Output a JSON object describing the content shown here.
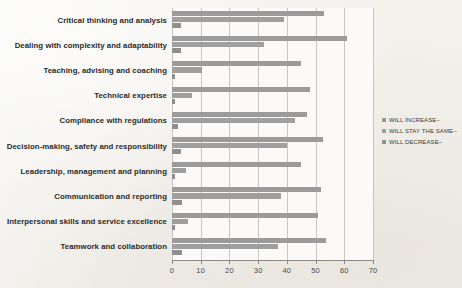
{
  "chart_data": {
    "type": "bar",
    "orientation": "horizontal",
    "title": "",
    "xlabel": "",
    "ylabel": "",
    "xlim": [
      0,
      70
    ],
    "xticks": [
      0,
      10,
      20,
      30,
      40,
      50,
      60,
      70
    ],
    "grid": true,
    "legend_position": "right",
    "categories": [
      "Critical thinking and analysis",
      "Dealing with complexity and adaptability",
      "Teaching, advising and coaching",
      "Technical expertise",
      "Compliance with regulations",
      "Decision-making, safety and responsibility",
      "Leadership, management and planning",
      "Communication and reporting",
      "Interpersonal skills and service excellence",
      "Teamwork and collaboration"
    ],
    "series": [
      {
        "name": "WILL INCREASE–",
        "color": "#9b9b9b",
        "values": [
          53,
          61,
          45,
          48,
          47,
          52.5,
          45,
          52,
          51,
          53.5
        ]
      },
      {
        "name": "WILL STAY THE SAME–",
        "color": "#9f9f9f",
        "values": [
          39,
          32,
          10.5,
          7,
          43,
          40,
          5,
          38,
          5.5,
          37
        ]
      },
      {
        "name": "WILL DECREASE–",
        "color": "#8f8f8f",
        "values": [
          3,
          3,
          1,
          1,
          2,
          3,
          1,
          3.5,
          1,
          3.5
        ]
      }
    ]
  },
  "legend": {
    "items": [
      {
        "label": "WILL INCREASE–"
      },
      {
        "label": "WILL STAY THE SAME–"
      },
      {
        "label": "WILL DECREASE–"
      }
    ]
  },
  "axis": {
    "tick_labels": [
      "0",
      "10",
      "20",
      "30",
      "40",
      "50",
      "60",
      "70"
    ]
  }
}
